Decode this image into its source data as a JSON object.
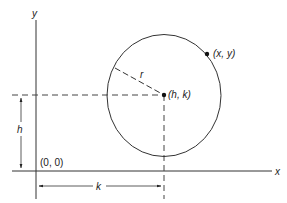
{
  "diagram": {
    "colors": {
      "ink": "#222222",
      "background": "#ffffff"
    },
    "axes": {
      "x_label": "x",
      "y_label": "y",
      "origin_label": "(0, 0)"
    },
    "circle": {
      "center_label": "(h, k)",
      "point_label": "(x, y)",
      "radius_label": "r"
    },
    "dimensions": {
      "horizontal_label": "k",
      "vertical_label": "h"
    }
  }
}
